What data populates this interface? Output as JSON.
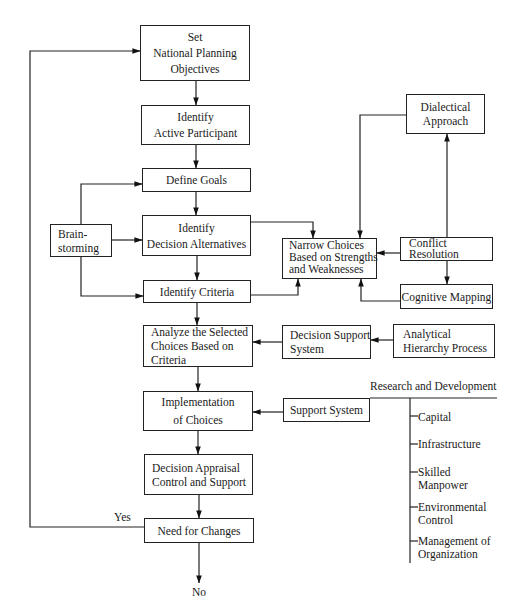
{
  "diagram": {
    "type": "flowchart",
    "main_flow": [
      {
        "id": "set_objectives",
        "lines": [
          "Set",
          "National Planning",
          "Objectives"
        ]
      },
      {
        "id": "identify_participant",
        "lines": [
          "Identify",
          "Active Participant"
        ]
      },
      {
        "id": "define_goals",
        "lines": [
          "Define Goals"
        ]
      },
      {
        "id": "identify_alternatives",
        "lines": [
          "Identify",
          "Decision Alternatives"
        ]
      },
      {
        "id": "identify_criteria",
        "lines": [
          "Identify Criteria"
        ]
      },
      {
        "id": "analyze_choices",
        "lines": [
          "Analyze the Selected",
          "Choices Based on",
          "Criteria"
        ]
      },
      {
        "id": "implementation",
        "lines": [
          "Implementation",
          "of Choices"
        ]
      },
      {
        "id": "decision_appraisal",
        "lines": [
          "Decision Appraisal",
          "Control and Support"
        ]
      },
      {
        "id": "need_for_changes",
        "lines": [
          "Need for Changes"
        ]
      }
    ],
    "side_nodes": {
      "brainstorming": {
        "lines": [
          "Brain-",
          "storming"
        ]
      },
      "narrow_choices": {
        "lines": [
          "Narrow Choices",
          "Based on Strengths",
          "and Weaknesses"
        ]
      },
      "dialectical": {
        "lines": [
          "Dialectical",
          "Approach"
        ]
      },
      "conflict_resolution": {
        "lines": [
          "Conflict",
          "Resolution"
        ]
      },
      "cognitive_mapping": {
        "lines": [
          "Cognitive Mapping"
        ]
      },
      "decision_support": {
        "lines": [
          "Decision Support",
          "System"
        ]
      },
      "ahp": {
        "lines": [
          "Analytical",
          "Hierarchy Process"
        ]
      },
      "support_system": {
        "lines": [
          "Support System"
        ]
      }
    },
    "support_branch": {
      "header": "Research and Development",
      "items": [
        {
          "lines": [
            "Capital"
          ]
        },
        {
          "lines": [
            "Infrastructure"
          ]
        },
        {
          "lines": [
            "Skilled",
            "Manpower"
          ]
        },
        {
          "lines": [
            "Environmental",
            "Control"
          ]
        },
        {
          "lines": [
            "Management of",
            "Organization"
          ]
        }
      ]
    },
    "edge_labels": {
      "yes": "Yes",
      "no": "No"
    }
  }
}
